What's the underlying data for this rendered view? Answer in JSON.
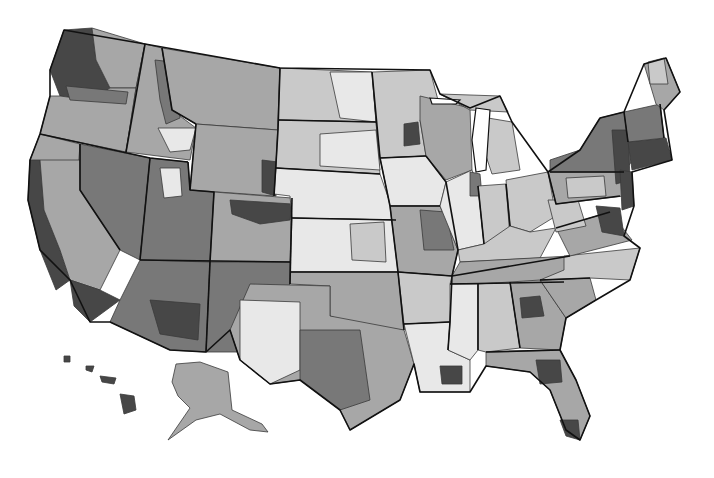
{
  "map": {
    "type": "choropleth",
    "subject": "United States regions shaded by category",
    "color_scheme": "grayscale",
    "legend": null,
    "title": null,
    "shade_levels": {
      "very_light": "#e8e8e8",
      "light": "#c9c9c9",
      "medium": "#a7a7a7",
      "dark": "#787878",
      "very_dark": "#474747"
    },
    "background": "#ffffff",
    "border_color": "#111111",
    "insets": [
      "Alaska",
      "Hawaii"
    ]
  },
  "regions": [
    {
      "name": "pacific-northwest-coast",
      "shade": "very_dark",
      "d": "M64,30 L92,28 L96,60 L110,88 L90,100 L60,96 L50,70 Z"
    },
    {
      "name": "washington-east",
      "shade": "medium",
      "d": "M92,28 L145,44 L136,88 L110,88 L96,60 Z"
    },
    {
      "name": "oregon",
      "shade": "medium",
      "d": "M50,96 L60,96 L90,100 L110,88 L136,88 L126,152 L40,134 Z"
    },
    {
      "name": "oregon-columbia-dark",
      "shade": "dark",
      "d": "M66,86 L128,92 L126,104 L70,100 Z"
    },
    {
      "name": "idaho",
      "shade": "medium",
      "d": "M145,44 L162,48 L172,110 L196,128 L190,160 L126,152 L136,88 Z"
    },
    {
      "name": "idaho-central-dark",
      "shade": "dark",
      "d": "M155,60 L172,62 L180,118 L166,124 L160,100 Z"
    },
    {
      "name": "idaho-south-light",
      "shade": "very_light",
      "d": "M158,128 L196,128 L190,150 L170,152 Z"
    },
    {
      "name": "montana",
      "shade": "medium",
      "d": "M162,48 L280,68 L278,130 L196,124 L172,110 Z"
    },
    {
      "name": "northern-california",
      "shade": "medium",
      "d": "M40,134 L80,144 L76,200 L60,214 L36,196 L30,160 Z"
    },
    {
      "name": "california-coast-dark",
      "shade": "very_dark",
      "d": "M30,160 L40,160 L44,210 L60,250 L70,280 L56,290 L40,250 L28,200 Z"
    },
    {
      "name": "central-california",
      "shade": "medium",
      "d": "M40,160 L80,160 L120,250 L100,290 L70,280 L60,250 L44,210 Z"
    },
    {
      "name": "nevada",
      "shade": "dark",
      "d": "M80,144 L150,158 L140,260 L120,250 L80,190 Z"
    },
    {
      "name": "southern-california-dark",
      "shade": "very_dark",
      "d": "M70,280 L100,290 L120,300 L90,322 L74,306 Z"
    },
    {
      "name": "utah",
      "shade": "dark",
      "d": "M150,158 L188,162 L190,190 L214,192 L210,262 L140,260 Z"
    },
    {
      "name": "utah-slc-light",
      "shade": "very_light",
      "d": "M160,168 L180,168 L182,196 L164,198 Z"
    },
    {
      "name": "wyoming",
      "shade": "medium",
      "d": "M196,124 L278,130 L274,196 L190,190 Z"
    },
    {
      "name": "wyoming-east-dark",
      "shade": "very_dark",
      "d": "M262,160 L278,162 L276,196 L262,192 Z"
    },
    {
      "name": "colorado",
      "shade": "medium",
      "d": "M214,192 L292,198 L290,262 L210,262 Z"
    },
    {
      "name": "colorado-front-dark",
      "shade": "very_dark",
      "d": "M230,200 L292,204 L290,220 L260,224 L232,214 Z"
    },
    {
      "name": "arizona",
      "shade": "dark",
      "d": "M140,260 L210,262 L206,352 L170,350 L110,322 L120,300 Z"
    },
    {
      "name": "arizona-south-dark",
      "shade": "very_dark",
      "d": "M150,300 L200,304 L198,340 L160,334 Z"
    },
    {
      "name": "new-mexico",
      "shade": "dark",
      "d": "M210,262 L290,262 L288,352 L206,352 Z"
    },
    {
      "name": "north-dakota",
      "shade": "light",
      "d": "M280,68 L372,72 L376,122 L278,120 Z"
    },
    {
      "name": "north-dakota-east-light",
      "shade": "very_light",
      "d": "M330,72 L372,72 L376,122 L340,118 Z"
    },
    {
      "name": "south-dakota",
      "shade": "light",
      "d": "M278,120 L376,122 L380,174 L276,168 Z"
    },
    {
      "name": "south-dakota-east-light",
      "shade": "very_light",
      "d": "M320,134 L376,130 L380,170 L320,166 Z"
    },
    {
      "name": "nebraska",
      "shade": "very_light",
      "d": "M276,168 L380,174 L396,220 L292,218 L290,196 L274,194 Z"
    },
    {
      "name": "kansas",
      "shade": "very_light",
      "d": "M292,218 L396,220 L398,272 L290,272 Z"
    },
    {
      "name": "kansas-east-light",
      "shade": "light",
      "d": "M350,224 L384,222 L386,262 L352,260 Z"
    },
    {
      "name": "oklahoma",
      "shade": "medium",
      "d": "M290,272 L398,272 L404,330 L360,326 L330,316 L330,286 L290,284 Z"
    },
    {
      "name": "texas",
      "shade": "medium",
      "d": "M250,284 L330,286 L330,316 L404,330 L414,364 L400,400 L350,430 L340,410 L300,380 L270,384 L240,360 L230,330 Z"
    },
    {
      "name": "texas-west-light",
      "shade": "very_light",
      "d": "M240,300 L300,302 L300,370 L270,384 L240,360 Z"
    },
    {
      "name": "texas-central-dark",
      "shade": "dark",
      "d": "M300,330 L360,330 L370,400 L340,410 L300,380 Z"
    },
    {
      "name": "minnesota",
      "shade": "light",
      "d": "M372,72 L430,70 L438,100 L420,120 L426,156 L380,158 L376,122 Z"
    },
    {
      "name": "minnesota-twin-cities-dark",
      "shade": "very_dark",
      "d": "M404,124 L418,122 L420,144 L404,146 Z"
    },
    {
      "name": "iowa",
      "shade": "very_light",
      "d": "M380,158 L426,156 L446,182 L440,206 L390,206 Z"
    },
    {
      "name": "missouri",
      "shade": "medium",
      "d": "M390,206 L440,206 L458,250 L452,276 L398,272 Z"
    },
    {
      "name": "missouri-east-dark",
      "shade": "dark",
      "d": "M420,210 L446,212 L454,250 L424,250 Z"
    },
    {
      "name": "arkansas",
      "shade": "light",
      "d": "M398,272 L452,276 L450,322 L404,324 Z"
    },
    {
      "name": "louisiana",
      "shade": "very_light",
      "d": "M404,324 L450,322 L448,350 L470,360 L470,392 L420,392 L414,364 Z"
    },
    {
      "name": "louisiana-new-orleans-dark",
      "shade": "very_dark",
      "d": "M440,366 L462,366 L462,384 L442,384 Z"
    },
    {
      "name": "wisconsin",
      "shade": "medium",
      "d": "M420,96 L470,108 L472,170 L446,180 L426,156 L420,120 Z"
    },
    {
      "name": "illinois",
      "shade": "very_light",
      "d": "M446,182 L472,170 L478,186 L484,244 L458,250 L440,206 Z"
    },
    {
      "name": "illinois-chicago-dark",
      "shade": "dark",
      "d": "M470,172 L480,174 L482,196 L470,196 Z"
    },
    {
      "name": "michigan-upper",
      "shade": "light",
      "d": "M440,94 L500,96 L508,112 L470,110 Z"
    },
    {
      "name": "michigan-lower",
      "shade": "light",
      "d": "M488,118 L512,122 L520,170 L492,174 L484,150 Z"
    },
    {
      "name": "indiana",
      "shade": "light",
      "d": "M478,186 L506,184 L510,238 L484,244 Z"
    },
    {
      "name": "ohio",
      "shade": "light",
      "d": "M506,180 L548,172 L556,216 L530,232 L510,226 Z"
    },
    {
      "name": "kentucky",
      "shade": "light",
      "d": "M458,250 L484,244 L510,226 L530,232 L556,228 L540,258 L460,262 Z"
    },
    {
      "name": "tennessee",
      "shade": "medium",
      "d": "M452,276 L460,262 L570,256 L564,282 L450,284 Z"
    },
    {
      "name": "mississippi",
      "shade": "very_light",
      "d": "M450,284 L478,284 L478,350 L470,360 L448,350 L450,322 Z"
    },
    {
      "name": "alabama",
      "shade": "light",
      "d": "M478,284 L510,282 L520,348 L486,352 L478,350 Z"
    },
    {
      "name": "georgia",
      "shade": "medium",
      "d": "M510,282 L540,280 L566,318 L560,350 L520,348 Z"
    },
    {
      "name": "georgia-atlanta-dark",
      "shade": "very_dark",
      "d": "M520,298 L540,296 L544,316 L522,318 Z"
    },
    {
      "name": "florida",
      "shade": "medium",
      "d": "M486,352 L560,350 L576,380 L590,416 L580,440 L566,430 L550,390 L530,372 L486,366 Z"
    },
    {
      "name": "florida-north-dark",
      "shade": "very_dark",
      "d": "M536,360 L560,360 L562,382 L540,384 Z"
    },
    {
      "name": "florida-south-dark",
      "shade": "very_dark",
      "d": "M560,420 L578,420 L580,440 L566,436 Z"
    },
    {
      "name": "south-carolina",
      "shade": "medium",
      "d": "M540,280 L590,278 L596,300 L566,318 Z"
    },
    {
      "name": "north-carolina",
      "shade": "light",
      "d": "M564,256 L640,248 L630,280 L590,278 L540,280 L564,270 Z"
    },
    {
      "name": "virginia",
      "shade": "medium",
      "d": "M556,228 L610,212 L632,240 L570,256 Z"
    },
    {
      "name": "virginia-dc-dark",
      "shade": "very_dark",
      "d": "M596,206 L620,208 L624,236 L602,232 Z"
    },
    {
      "name": "west-virginia",
      "shade": "light",
      "d": "M548,200 L578,200 L586,226 L556,232 Z"
    },
    {
      "name": "pennsylvania",
      "shade": "medium",
      "d": "M548,172 L620,164 L624,196 L556,204 Z"
    },
    {
      "name": "pennsylvania-central-light",
      "shade": "light",
      "d": "M566,178 L604,176 L606,196 L568,198 Z"
    },
    {
      "name": "new-york",
      "shade": "dark",
      "d": "M550,160 L580,150 L600,118 L624,112 L640,150 L624,172 L550,172 Z"
    },
    {
      "name": "new-york-hudson-dark",
      "shade": "very_dark",
      "d": "M612,130 L628,130 L630,180 L616,184 Z"
    },
    {
      "name": "new-jersey",
      "shade": "very_dark",
      "d": "M620,170 L632,172 L634,206 L622,210 Z"
    },
    {
      "name": "new-england-south",
      "shade": "very_dark",
      "d": "M628,142 L666,138 L672,160 L632,170 Z"
    },
    {
      "name": "vermont-new-hampshire",
      "shade": "dark",
      "d": "M624,112 L660,104 L664,138 L628,142 Z"
    },
    {
      "name": "maine",
      "shade": "medium",
      "d": "M644,64 L666,58 L680,92 L664,110 L656,104 Z"
    },
    {
      "name": "maine-north-light",
      "shade": "light",
      "d": "M648,62 L664,58 L668,84 L650,84 Z"
    },
    {
      "name": "alaska",
      "shade": "medium",
      "d": "M176,364 L200,362 L228,372 L232,410 L262,424 L268,432 L250,430 L220,414 L196,420 L168,440 L190,408 L178,396 L172,382 Z"
    },
    {
      "name": "hawaii-big-island",
      "shade": "very_dark",
      "d": "M120,394 L134,396 L136,410 L124,414 Z"
    },
    {
      "name": "hawaii-maui",
      "shade": "very_dark",
      "d": "M100,376 L116,378 L114,384 L102,382 Z"
    },
    {
      "name": "hawaii-oahu",
      "shade": "very_dark",
      "d": "M86,366 L94,366 L92,372 L86,370 Z"
    },
    {
      "name": "hawaii-kauai",
      "shade": "very_dark",
      "d": "M64,356 L70,356 L70,362 L64,362 Z"
    }
  ],
  "state_outline": "M64,30 L145,44 L280,68 L430,70 L440,94 L470,108 L500,96 L512,122 L548,172 L580,150 L600,118 L624,112 L644,64 L666,58 L680,92 L664,110 L672,160 L632,172 L634,206 L624,236 L640,248 L630,280 L596,300 L566,318 L560,350 L576,380 L590,416 L580,440 L566,430 L550,390 L530,372 L486,366 L470,392 L420,392 L414,364 L400,400 L350,430 L340,410 L300,380 L270,384 L240,360 L230,330 L206,352 L170,350 L110,322 L90,322 L70,280 L40,250 L28,200 L30,160 L40,134 L50,96 L50,70 Z",
  "state_lines": [
    "M145,44 L126,152",
    "M162,48 L172,110 L196,124",
    "M196,124 L190,190",
    "M280,68 L278,130 L274,196",
    "M40,134 L150,158 L188,162",
    "M80,144 L80,190 L120,250",
    "M150,158 L140,260",
    "M188,162 L190,190 L214,192 L210,262",
    "M140,260 L290,262",
    "M210,262 L206,352",
    "M292,198 L290,284",
    "M278,120 L376,122",
    "M276,168 L380,174",
    "M292,218 L396,220",
    "M290,272 L398,272",
    "M372,72 L380,158 L390,206 L398,272 L404,330",
    "M380,158 L426,156",
    "M390,206 L440,206",
    "M398,272 L452,276",
    "M404,324 L450,322",
    "M426,156 L446,182 L458,250 L452,276 L450,322 L448,350",
    "M478,186 L484,244",
    "M506,184 L510,226",
    "M452,276 L570,256",
    "M450,284 L564,282",
    "M478,284 L478,350",
    "M510,282 L520,348",
    "M486,352 L560,350",
    "M540,280 L590,278",
    "M556,228 L610,212",
    "M548,172 L556,204 L620,196",
    "M550,172 L624,172",
    "M624,112 L628,142",
    "M660,104 L664,138"
  ],
  "lakes": [
    "M476,108 L490,110 L486,170 L476,172 L472,140 Z",
    "M430,98 L460,100 L456,104 L432,104 Z"
  ]
}
